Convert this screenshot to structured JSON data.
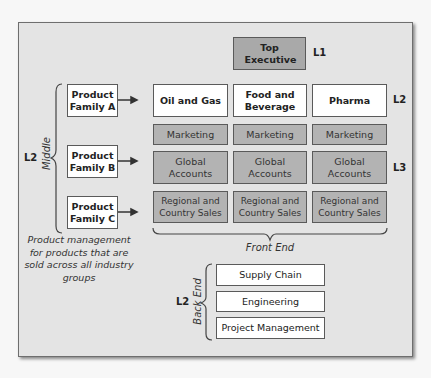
{
  "top": {
    "label": "Top Executive",
    "level": "L1"
  },
  "industry_groups": [
    {
      "label": "Oil and Gas"
    },
    {
      "label": "Food and Beverage"
    },
    {
      "label": "Pharma"
    }
  ],
  "industry_level": "L2",
  "functions": {
    "marketing": [
      "Marketing",
      "Marketing",
      "Marketing"
    ],
    "global_accounts": [
      "Global Accounts",
      "Global Accounts",
      "Global Accounts"
    ],
    "regional_sales": [
      "Regional and Country Sales",
      "Regional and Country Sales",
      "Regional and Country Sales"
    ],
    "level": "L3"
  },
  "front_end_label": "Front End",
  "middle": {
    "label": "Middle",
    "level": "L2",
    "product_families": [
      "Product Family A",
      "Product Family B",
      "Product Family C"
    ],
    "note": "Product management for products that are sold across all industry groups"
  },
  "back_end": {
    "label": "Back End",
    "level": "L2",
    "items": [
      "Supply Chain",
      "Engineering",
      "Project Management"
    ]
  },
  "colors": {
    "panel": "#e4e4e4",
    "white_box": "#ffffff",
    "gray_box": "#b3b3b3",
    "border": "#5a5a5a"
  }
}
